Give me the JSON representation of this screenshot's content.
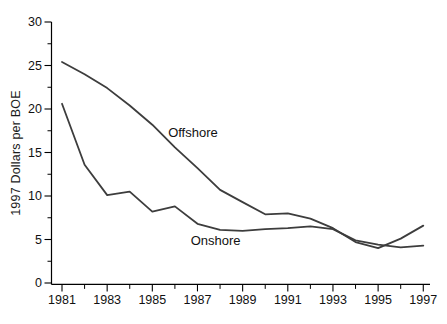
{
  "window": {
    "width": 447,
    "height": 324,
    "background": "#ffffff"
  },
  "chart_data": {
    "type": "line",
    "title": "",
    "xlabel": "",
    "ylabel": "1997 Dollars per BOE",
    "x": [
      1981,
      1982,
      1983,
      1984,
      1985,
      1986,
      1987,
      1988,
      1989,
      1990,
      1991,
      1992,
      1993,
      1994,
      1995,
      1996,
      1997
    ],
    "series": [
      {
        "name": "Offshore",
        "color": "#3d3d3d",
        "values": [
          25.4,
          24.0,
          22.4,
          20.4,
          18.2,
          15.6,
          13.2,
          10.7,
          9.3,
          7.9,
          8.0,
          7.4,
          6.3,
          4.7,
          4.0,
          5.1,
          6.6
        ]
      },
      {
        "name": "Onshore",
        "color": "#3d3d3d",
        "values": [
          20.6,
          13.6,
          10.1,
          10.5,
          8.2,
          8.8,
          6.8,
          6.1,
          6.0,
          6.2,
          6.3,
          6.5,
          6.2,
          4.9,
          4.4,
          4.1,
          4.3
        ]
      }
    ],
    "annotations": [
      {
        "text": "Offshore",
        "year": 1985.7,
        "value": 17.3,
        "anchor": "start"
      },
      {
        "text": "Onshore",
        "year": 1986.7,
        "value": 4.9,
        "anchor": "start"
      }
    ],
    "xlim": [
      1981,
      1997
    ],
    "ylim": [
      0,
      30
    ],
    "x_major_ticks": [
      1981,
      1983,
      1985,
      1987,
      1989,
      1991,
      1993,
      1995,
      1997
    ],
    "x_tick_labels": [
      "1981",
      "1983",
      "1985",
      "1987",
      "1989",
      "1991",
      "1993",
      "1995",
      "1997"
    ],
    "x_minor_ticks": [
      1982,
      1984,
      1986,
      1988,
      1990,
      1992,
      1994,
      1996
    ],
    "y_major_ticks": [
      0,
      5,
      10,
      15,
      20,
      25,
      30
    ],
    "y_tick_labels": [
      "0",
      "5",
      "10",
      "15",
      "20",
      "25",
      "30"
    ],
    "y_minor_ticks": [
      2.5,
      7.5,
      12.5,
      17.5,
      22.5,
      27.5
    ],
    "grid": false,
    "legend": "inline-labels",
    "axis_color": "#000000",
    "tick_label_color": "#111111"
  }
}
